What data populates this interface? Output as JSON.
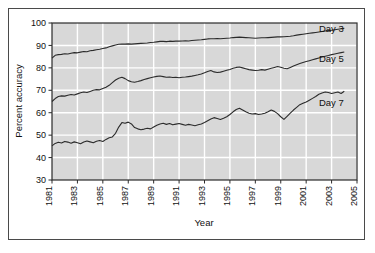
{
  "chart_data": {
    "type": "line",
    "title": "",
    "xlabel": "Year",
    "ylabel": "Percent accuracy",
    "xlim": [
      1981,
      2005
    ],
    "ylim": [
      30,
      100
    ],
    "ytick_labels": [
      "100",
      "90",
      "80",
      "70",
      "60",
      "50",
      "40",
      "30"
    ],
    "yticks": [
      100,
      90,
      80,
      70,
      60,
      50,
      40,
      30
    ],
    "xtick_labels": [
      "1981",
      "1983",
      "1985",
      "1987",
      "1989",
      "1991",
      "1993",
      "1995",
      "1997",
      "1999",
      "2001",
      "2003",
      "2005"
    ],
    "xticks": [
      1981,
      1983,
      1985,
      1987,
      1989,
      1991,
      1993,
      1995,
      1997,
      1999,
      2001,
      2003,
      2005
    ],
    "grid": true,
    "grid_color": "#ffffff",
    "plot_background": "#d8d8d8",
    "line_color": "#2b2b2b",
    "legend_position": "inline-right",
    "series": [
      {
        "name": "Day 3",
        "label": "Day 3",
        "label_x": 2002.0,
        "label_y": 95.8,
        "x": [
          1981.0,
          1981.25,
          1981.5,
          1981.75,
          1982.0,
          1982.25,
          1982.5,
          1982.75,
          1983.0,
          1983.25,
          1983.5,
          1983.75,
          1984.0,
          1984.25,
          1984.5,
          1984.75,
          1985.0,
          1985.25,
          1985.5,
          1985.75,
          1986.0,
          1986.25,
          1986.5,
          1986.75,
          1987.0,
          1987.25,
          1987.5,
          1987.75,
          1988.0,
          1988.25,
          1988.5,
          1988.75,
          1989.0,
          1989.25,
          1989.5,
          1989.75,
          1990.0,
          1990.25,
          1990.5,
          1990.75,
          1991.0,
          1991.25,
          1991.5,
          1991.75,
          1992.0,
          1992.25,
          1992.5,
          1992.75,
          1993.0,
          1993.25,
          1993.5,
          1993.75,
          1994.0,
          1994.25,
          1994.5,
          1994.75,
          1995.0,
          1995.25,
          1995.5,
          1995.75,
          1996.0,
          1996.25,
          1996.5,
          1996.75,
          1997.0,
          1997.25,
          1997.5,
          1997.75,
          1998.0,
          1998.25,
          1998.5,
          1998.75,
          1999.0,
          1999.25,
          1999.5,
          1999.75,
          2000.0,
          2000.25,
          2000.5,
          2000.75,
          2001.0,
          2001.25,
          2001.5,
          2001.75,
          2002.0,
          2002.25,
          2002.5,
          2002.75,
          2003.0,
          2003.25,
          2003.5,
          2003.75,
          2004.0
        ],
        "y": [
          84.3,
          85.6,
          85.9,
          86.0,
          86.3,
          86.2,
          86.5,
          86.8,
          86.7,
          87.0,
          87.3,
          87.2,
          87.6,
          87.8,
          88.1,
          88.3,
          88.6,
          88.9,
          89.4,
          89.8,
          90.2,
          90.5,
          90.6,
          90.6,
          90.7,
          90.6,
          90.7,
          90.8,
          90.9,
          91.0,
          91.1,
          91.3,
          91.4,
          91.6,
          91.8,
          91.8,
          91.7,
          91.9,
          91.8,
          91.9,
          91.9,
          92.0,
          92.1,
          92.0,
          92.2,
          92.3,
          92.4,
          92.5,
          92.7,
          92.9,
          93.0,
          93.0,
          93.1,
          93.0,
          93.1,
          93.2,
          93.3,
          93.5,
          93.6,
          93.7,
          93.6,
          93.5,
          93.4,
          93.3,
          93.2,
          93.3,
          93.4,
          93.4,
          93.5,
          93.6,
          93.7,
          93.8,
          93.8,
          93.9,
          94.0,
          94.1,
          94.3,
          94.6,
          94.8,
          95.0,
          95.2,
          95.4,
          95.6,
          95.8,
          96.0,
          96.2,
          96.4,
          96.6,
          96.8,
          97.0,
          97.2,
          97.4,
          97.6
        ]
      },
      {
        "name": "Day 5",
        "label": "Day 5",
        "label_x": 2002.0,
        "label_y": 82.5,
        "x": [
          1981.0,
          1981.25,
          1981.5,
          1981.75,
          1982.0,
          1982.25,
          1982.5,
          1982.75,
          1983.0,
          1983.25,
          1983.5,
          1983.75,
          1984.0,
          1984.25,
          1984.5,
          1984.75,
          1985.0,
          1985.25,
          1985.5,
          1985.75,
          1986.0,
          1986.25,
          1986.5,
          1986.75,
          1987.0,
          1987.25,
          1987.5,
          1987.75,
          1988.0,
          1988.25,
          1988.5,
          1988.75,
          1989.0,
          1989.25,
          1989.5,
          1989.75,
          1990.0,
          1990.25,
          1990.5,
          1990.75,
          1991.0,
          1991.25,
          1991.5,
          1991.75,
          1992.0,
          1992.25,
          1992.5,
          1992.75,
          1993.0,
          1993.25,
          1993.5,
          1993.75,
          1994.0,
          1994.25,
          1994.5,
          1994.75,
          1995.0,
          1995.25,
          1995.5,
          1995.75,
          1996.0,
          1996.25,
          1996.5,
          1996.75,
          1997.0,
          1997.25,
          1997.5,
          1997.75,
          1998.0,
          1998.25,
          1998.5,
          1998.75,
          1999.0,
          1999.25,
          1999.5,
          1999.75,
          2000.0,
          2000.25,
          2000.5,
          2000.75,
          2001.0,
          2001.25,
          2001.5,
          2001.75,
          2002.0,
          2002.25,
          2002.5,
          2002.75,
          2003.0,
          2003.25,
          2003.5,
          2003.75,
          2004.0
        ],
        "y": [
          65.0,
          66.3,
          67.2,
          67.5,
          67.4,
          67.8,
          68.1,
          67.9,
          68.4,
          68.9,
          69.2,
          69.0,
          69.5,
          70.0,
          70.3,
          70.2,
          70.8,
          71.4,
          72.2,
          73.4,
          74.6,
          75.4,
          75.8,
          75.2,
          74.3,
          73.8,
          73.6,
          73.9,
          74.3,
          74.8,
          75.2,
          75.6,
          75.9,
          76.2,
          76.4,
          76.1,
          75.8,
          75.9,
          75.7,
          75.8,
          75.6,
          75.8,
          75.9,
          76.1,
          76.3,
          76.6,
          76.9,
          77.3,
          77.8,
          78.4,
          78.8,
          78.2,
          77.9,
          78.1,
          78.5,
          78.9,
          79.3,
          79.8,
          80.2,
          80.4,
          80.0,
          79.6,
          79.2,
          79.0,
          78.8,
          78.9,
          79.2,
          79.0,
          79.4,
          79.8,
          80.2,
          80.6,
          80.3,
          79.8,
          79.6,
          80.2,
          80.8,
          81.4,
          81.9,
          82.4,
          82.8,
          83.2,
          83.6,
          84.0,
          84.4,
          84.8,
          85.2,
          85.5,
          85.9,
          86.2,
          86.5,
          86.8,
          87.1
        ]
      },
      {
        "name": "Day 7",
        "label": "Day 7",
        "label_x": 2002.0,
        "label_y": 63.0,
        "x": [
          1981.0,
          1981.25,
          1981.5,
          1981.75,
          1982.0,
          1982.25,
          1982.5,
          1982.75,
          1983.0,
          1983.25,
          1983.5,
          1983.75,
          1984.0,
          1984.25,
          1984.5,
          1984.75,
          1985.0,
          1985.25,
          1985.5,
          1985.75,
          1986.0,
          1986.25,
          1986.5,
          1986.75,
          1987.0,
          1987.25,
          1987.5,
          1987.75,
          1988.0,
          1988.25,
          1988.5,
          1988.75,
          1989.0,
          1989.25,
          1989.5,
          1989.75,
          1990.0,
          1990.25,
          1990.5,
          1990.75,
          1991.0,
          1991.25,
          1991.5,
          1991.75,
          1992.0,
          1992.25,
          1992.5,
          1992.75,
          1993.0,
          1993.25,
          1993.5,
          1993.75,
          1994.0,
          1994.25,
          1994.5,
          1994.75,
          1995.0,
          1995.25,
          1995.5,
          1995.75,
          1996.0,
          1996.25,
          1996.5,
          1996.75,
          1997.0,
          1997.25,
          1997.5,
          1997.75,
          1998.0,
          1998.25,
          1998.5,
          1998.75,
          1999.0,
          1999.25,
          1999.5,
          1999.75,
          2000.0,
          2000.25,
          2000.5,
          2000.75,
          2001.0,
          2001.25,
          2001.5,
          2001.75,
          2002.0,
          2002.25,
          2002.5,
          2002.75,
          2003.0,
          2003.25,
          2003.5,
          2003.75,
          2004.0
        ],
        "y": [
          45.2,
          46.3,
          46.8,
          46.5,
          47.2,
          46.9,
          46.4,
          47.0,
          46.6,
          46.2,
          46.9,
          47.4,
          47.0,
          46.6,
          47.3,
          47.6,
          47.2,
          48.1,
          48.8,
          49.2,
          50.8,
          53.6,
          55.6,
          55.3,
          55.8,
          55.0,
          53.4,
          52.8,
          52.4,
          52.7,
          53.1,
          52.8,
          53.6,
          54.4,
          55.0,
          55.3,
          54.8,
          55.2,
          54.6,
          54.9,
          55.2,
          54.8,
          54.4,
          54.8,
          54.5,
          54.2,
          54.6,
          55.0,
          55.6,
          56.4,
          57.2,
          57.8,
          57.4,
          57.0,
          57.5,
          58.2,
          59.2,
          60.4,
          61.4,
          62.0,
          61.2,
          60.4,
          59.8,
          59.4,
          59.6,
          59.2,
          59.4,
          59.8,
          60.4,
          61.2,
          60.6,
          59.6,
          58.2,
          57.0,
          58.4,
          59.8,
          61.2,
          62.4,
          63.6,
          64.2,
          64.8,
          65.6,
          66.4,
          67.2,
          68.2,
          68.8,
          69.2,
          69.0,
          68.6,
          68.9,
          69.2,
          68.6,
          69.6
        ]
      }
    ]
  }
}
